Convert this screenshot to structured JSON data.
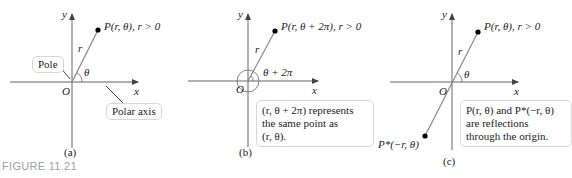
{
  "figure": {
    "label": "FIGURE 11.21",
    "caption_color": "#9aa0a6",
    "axis_color": "#555555",
    "ray_color": "#8a8a8a",
    "point_color": "#000000"
  },
  "panels": [
    {
      "id": "a",
      "caption": "(a)",
      "x_label": "x",
      "y_label": "y",
      "origin_label": "O",
      "point_label": "P(r, θ), r > 0",
      "ray_label": "r",
      "angle_label": "θ",
      "callouts": [
        {
          "text": "Pole"
        },
        {
          "text": "Polar axis"
        }
      ]
    },
    {
      "id": "b",
      "caption": "(b)",
      "x_label": "x",
      "y_label": "y",
      "origin_label": "O",
      "point_label": "P(r, θ + 2π), r > 0",
      "ray_label": "r",
      "angle_label": "θ + 2π",
      "note_lines": [
        "(r, θ + 2π) represents",
        "the same point as",
        "(r, θ)."
      ]
    },
    {
      "id": "c",
      "caption": "(c)",
      "x_label": "x",
      "y_label": "y",
      "origin_label": "O",
      "point_label": "P(r, θ), r > 0",
      "reflected_point_label": "P*(−r, θ)",
      "ray_label": "r",
      "angle_label": "θ",
      "note_lines": [
        "P(r, θ) and P*(−r, θ)",
        "are reflections",
        "through the origin."
      ]
    }
  ]
}
